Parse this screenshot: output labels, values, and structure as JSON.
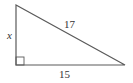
{
  "diagram": {
    "type": "right-triangle",
    "labels": {
      "vertical_leg": "x",
      "hypotenuse": "17",
      "horizontal_leg": "15"
    },
    "right_angle_marker": true,
    "stroke_color": "#5a5a5a",
    "label_color": "#333333"
  }
}
